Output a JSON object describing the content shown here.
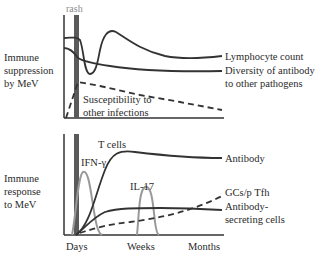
{
  "colors": {
    "dark_line": "#333333",
    "gray_line": "#999999",
    "rash_bar": "#5a5a5a",
    "rash_label": "#8a8a8a"
  },
  "top_panel": {
    "ylabel_lines": [
      "Immune",
      "suppression",
      "by MeV"
    ],
    "rash_label": "rash",
    "curves": [
      {
        "name": "Lymphocyte count",
        "style": "solid-dark"
      },
      {
        "name": "Diversity of antibody to other pathogens",
        "label_lines": [
          "Diversity of antibody",
          "to other pathogens"
        ],
        "style": "solid-dark"
      },
      {
        "name": "Susceptibility to other infections",
        "label_lines": [
          "Susceptibility to",
          "other infections"
        ],
        "style": "dashed-dark"
      }
    ]
  },
  "bottom_panel": {
    "ylabel_lines": [
      "Immune",
      "response",
      "to MeV"
    ],
    "curves": [
      {
        "name": "T cells",
        "style": "solid-dark"
      },
      {
        "name": "IFN-γ",
        "style": "solid-gray"
      },
      {
        "name": "IL-17",
        "style": "solid-gray"
      },
      {
        "name": "Antibody",
        "style": "solid-dark"
      },
      {
        "name": "GCs/p Tfh",
        "style": "dashed-dark"
      },
      {
        "name": "Antibody-secreting cells",
        "label_lines": [
          "Antibody-",
          "secreting cells"
        ],
        "style": "solid-dark"
      }
    ],
    "x_ticks": [
      "Days",
      "Weeks",
      "Months"
    ]
  }
}
